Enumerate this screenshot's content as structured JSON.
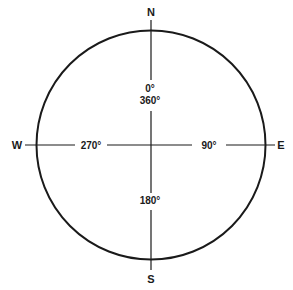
{
  "diagram": {
    "cardinals": {
      "north": "N",
      "east": "E",
      "south": "S",
      "west": "W"
    },
    "degrees": {
      "north_top": "0°",
      "north_bottom": "360°",
      "east": "90°",
      "south": "180°",
      "west": "270°"
    },
    "colors": {
      "stroke": "#1a1a1a",
      "background": "#ffffff"
    }
  }
}
